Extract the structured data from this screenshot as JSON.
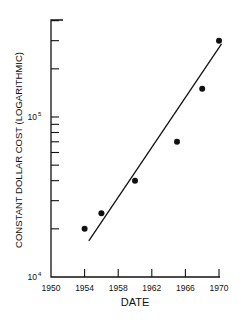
{
  "chart_data": {
    "type": "scatter",
    "title": "",
    "xlabel": "DATE",
    "ylabel": "CONSTANT DOLLAR COST (LOGARITHMIC)",
    "yscale": "log",
    "xlim": [
      1950,
      1970
    ],
    "ylim": [
      10000,
      450000
    ],
    "x_ticks": [
      1950,
      1954,
      1958,
      1962,
      1966,
      1970
    ],
    "x_tick_labels": [
      "1950",
      "1954",
      "1958",
      "1962",
      "1966",
      "1970"
    ],
    "y_tick_labels": [
      {
        "value": 10000,
        "base": "10",
        "exp": "4"
      },
      {
        "value": 100000,
        "base": "10",
        "exp": "5"
      }
    ],
    "y_minor_ticks": [
      20000,
      30000,
      40000,
      50000,
      60000,
      70000,
      80000,
      90000,
      200000,
      300000,
      400000
    ],
    "grid": false,
    "legend": null,
    "series": [
      {
        "name": "observed",
        "type": "scatter",
        "x": [
          1954,
          1956,
          1960,
          1965,
          1968,
          1970
        ],
        "y": [
          20000,
          25000,
          40000,
          70000,
          150000,
          300000
        ]
      },
      {
        "name": "trend",
        "type": "line",
        "x": [
          1954.5,
          1970.3
        ],
        "y": [
          16800,
          286000
        ]
      }
    ]
  }
}
